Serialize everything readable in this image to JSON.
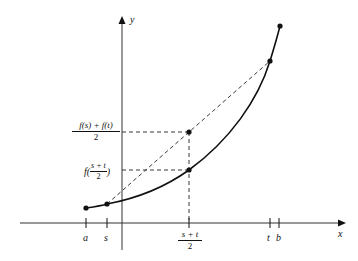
{
  "diagram": {
    "axes": {
      "x_label": "x",
      "y_label": "y"
    },
    "x_ticks": [
      {
        "id": "a",
        "label": "a"
      },
      {
        "id": "s",
        "label": "s"
      },
      {
        "id": "mid",
        "numerator": "s + t",
        "denominator": "2"
      },
      {
        "id": "t",
        "label": "t"
      },
      {
        "id": "b",
        "label": "b"
      }
    ],
    "y_labels": {
      "chord_mid": {
        "numerator": "f(s) + f(t)",
        "denominator": "2"
      },
      "curve_mid": {
        "prefix": "f(",
        "numerator": "s + t",
        "denominator": "2",
        "suffix": ")"
      }
    },
    "colors": {
      "line": "#111111",
      "axis": "#333333",
      "background": "#ffffff"
    }
  }
}
